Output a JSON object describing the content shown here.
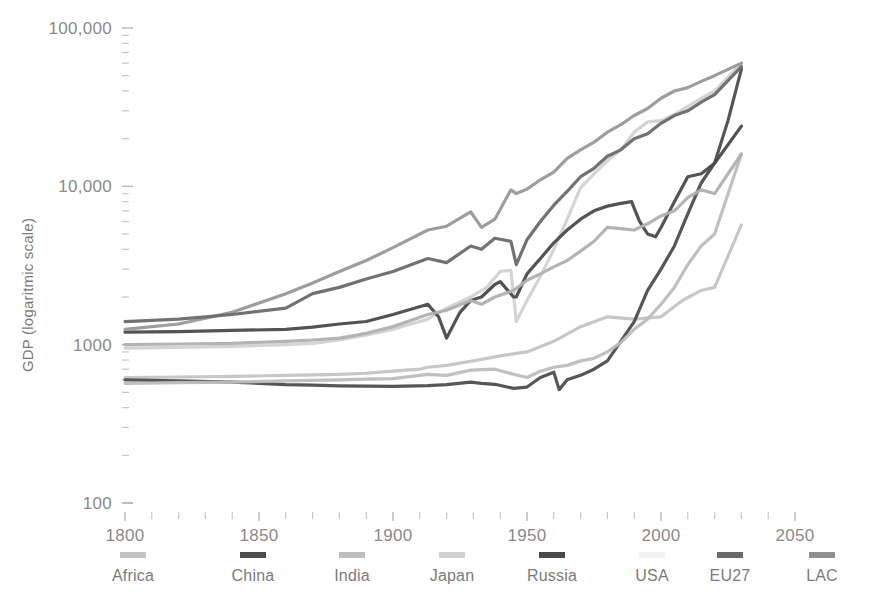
{
  "chart_data": {
    "type": "line",
    "title": "",
    "subtitle": "",
    "xlabel": "",
    "ylabel": "GDP (logaritmic scale)",
    "y_scale": "log",
    "ylim": [
      100,
      100000
    ],
    "xlim": [
      1800,
      2050
    ],
    "y_ticks": [
      "100",
      "1000",
      "10,000",
      "100,000"
    ],
    "y_tick_values": [
      100,
      1000,
      10000,
      100000
    ],
    "x_ticks": [
      "1800",
      "1850",
      "1900",
      "1950",
      "2000",
      "2050"
    ],
    "x_tick_values": [
      1800,
      1850,
      1900,
      1950,
      2000,
      2050
    ],
    "x_minor_step": 10,
    "grid": false,
    "legend_position": "bottom",
    "legend": [
      "Africa",
      "China",
      "India",
      "Japan",
      "Russia",
      "USA",
      "EU27",
      "LAC"
    ],
    "series": [
      {
        "name": "Africa",
        "color": "#c4c4c4",
        "x": [
          1800,
          1820,
          1840,
          1860,
          1870,
          1880,
          1890,
          1900,
          1910,
          1913,
          1920,
          1930,
          1940,
          1950,
          1960,
          1970,
          1980,
          1990,
          2000,
          2008,
          2015,
          2020,
          2030
        ],
        "values": [
          620,
          625,
          630,
          640,
          645,
          650,
          660,
          680,
          700,
          720,
          740,
          790,
          850,
          900,
          1050,
          1300,
          1500,
          1450,
          1500,
          1900,
          2200,
          2300,
          5700
        ]
      },
      {
        "name": "China",
        "color": "#4d4d4d",
        "x": [
          1800,
          1820,
          1840,
          1860,
          1870,
          1880,
          1890,
          1900,
          1913,
          1920,
          1929,
          1933,
          1938,
          1945,
          1950,
          1955,
          1960,
          1962,
          1965,
          1970,
          1975,
          1980,
          1985,
          1990,
          1995,
          2000,
          2005,
          2010,
          2015,
          2020,
          2025,
          2030
        ],
        "values": [
          600,
          590,
          580,
          560,
          555,
          550,
          548,
          545,
          552,
          560,
          580,
          570,
          562,
          530,
          540,
          620,
          670,
          520,
          600,
          640,
          700,
          790,
          1050,
          1400,
          2200,
          3000,
          4200,
          6700,
          10500,
          14000,
          26000,
          55000
        ]
      },
      {
        "name": "India",
        "color": "#bdbdbd",
        "x": [
          1800,
          1820,
          1840,
          1860,
          1870,
          1880,
          1890,
          1900,
          1913,
          1920,
          1929,
          1938,
          1945,
          1950,
          1955,
          1960,
          1965,
          1970,
          1975,
          1980,
          1985,
          1990,
          1995,
          2000,
          2005,
          2010,
          2015,
          2020,
          2030
        ],
        "values": [
          570,
          575,
          580,
          590,
          595,
          600,
          605,
          610,
          650,
          640,
          690,
          700,
          650,
          620,
          680,
          720,
          740,
          790,
          820,
          900,
          1030,
          1250,
          1450,
          1800,
          2300,
          3200,
          4200,
          5000,
          16000
        ]
      },
      {
        "name": "Japan",
        "color": "#d2d2d2",
        "x": [
          1800,
          1820,
          1840,
          1860,
          1870,
          1880,
          1890,
          1900,
          1913,
          1920,
          1929,
          1935,
          1940,
          1944,
          1946,
          1950,
          1955,
          1960,
          1965,
          1970,
          1975,
          1980,
          1985,
          1990,
          1995,
          2000,
          2005,
          2010,
          2015,
          2020,
          2030
        ],
        "values": [
          950,
          960,
          975,
          1000,
          1020,
          1070,
          1150,
          1250,
          1450,
          1700,
          2000,
          2300,
          2900,
          2950,
          1400,
          1900,
          2700,
          4000,
          6200,
          9800,
          12000,
          14500,
          17000,
          22000,
          25500,
          26000,
          28500,
          32000,
          36000,
          40000,
          60000
        ]
      },
      {
        "name": "Russia",
        "color": "#4a4a4a",
        "x": [
          1800,
          1820,
          1840,
          1860,
          1870,
          1880,
          1890,
          1900,
          1913,
          1917,
          1920,
          1925,
          1929,
          1933,
          1938,
          1940,
          1945,
          1946,
          1950,
          1955,
          1960,
          1965,
          1970,
          1975,
          1980,
          1985,
          1989,
          1992,
          1995,
          1998,
          2000,
          2005,
          2010,
          2015,
          2020,
          2030
        ],
        "values": [
          1200,
          1210,
          1230,
          1250,
          1290,
          1350,
          1400,
          1550,
          1800,
          1500,
          1100,
          1600,
          1900,
          2000,
          2400,
          2500,
          2000,
          2000,
          2800,
          3500,
          4400,
          5300,
          6200,
          7000,
          7500,
          7800,
          8000,
          6000,
          5000,
          4800,
          5500,
          8000,
          11500,
          12000,
          14000,
          24000
        ]
      },
      {
        "name": "USA",
        "color": "#989898",
        "x": [
          1800,
          1820,
          1840,
          1860,
          1870,
          1880,
          1890,
          1900,
          1913,
          1920,
          1929,
          1933,
          1938,
          1944,
          1946,
          1950,
          1955,
          1960,
          1965,
          1970,
          1975,
          1980,
          1985,
          1990,
          1995,
          2000,
          2005,
          2010,
          2015,
          2020,
          2030
        ],
        "values": [
          1250,
          1350,
          1600,
          2100,
          2450,
          2900,
          3400,
          4100,
          5300,
          5600,
          6900,
          5500,
          6200,
          9500,
          9000,
          9600,
          11000,
          12300,
          15000,
          17000,
          19000,
          22000,
          24500,
          28000,
          31000,
          36000,
          40000,
          42000,
          46000,
          50000,
          60000
        ]
      },
      {
        "name": "EU27",
        "color": "#6a6a6a",
        "x": [
          1800,
          1820,
          1840,
          1860,
          1870,
          1880,
          1890,
          1900,
          1913,
          1920,
          1929,
          1933,
          1938,
          1944,
          1946,
          1950,
          1955,
          1960,
          1965,
          1970,
          1975,
          1980,
          1985,
          1990,
          1995,
          2000,
          2005,
          2010,
          2015,
          2020,
          2030
        ],
        "values": [
          1400,
          1450,
          1550,
          1700,
          2100,
          2300,
          2600,
          2900,
          3500,
          3300,
          4200,
          4000,
          4700,
          4500,
          3200,
          4600,
          6000,
          7600,
          9300,
          11500,
          13000,
          15500,
          17000,
          20000,
          21500,
          25000,
          28000,
          30000,
          34000,
          38000,
          57000
        ]
      },
      {
        "name": "LAC",
        "color": "#b0b0b0",
        "x": [
          1800,
          1820,
          1840,
          1860,
          1870,
          1880,
          1890,
          1900,
          1913,
          1920,
          1929,
          1933,
          1938,
          1945,
          1950,
          1955,
          1960,
          1965,
          1970,
          1975,
          1980,
          1985,
          1990,
          1995,
          2000,
          2005,
          2010,
          2015,
          2020,
          2030
        ],
        "values": [
          1000,
          1010,
          1020,
          1050,
          1070,
          1100,
          1180,
          1300,
          1550,
          1650,
          1900,
          1800,
          2000,
          2200,
          2550,
          2800,
          3100,
          3400,
          3900,
          4500,
          5500,
          5400,
          5300,
          5800,
          6500,
          7000,
          8500,
          9500,
          9000,
          16000
        ]
      }
    ]
  },
  "legend_items": [
    {
      "label": "Africa",
      "color": "#c4c4c4"
    },
    {
      "label": "China",
      "color": "#4d4d4d"
    },
    {
      "label": "India",
      "color": "#bdbdbd"
    },
    {
      "label": "Japan",
      "color": "#d2d2d2"
    },
    {
      "label": "Russia",
      "color": "#4a4a4a"
    },
    {
      "label": "USA",
      "color": "#f2f2f2"
    },
    {
      "label": "EU27",
      "color": "#6a6a6a"
    },
    {
      "label": "LAC",
      "color": "#8f8f8f"
    }
  ],
  "colors": {
    "background": "#ffffff",
    "text": "#7f7f7f",
    "tick": "#bdbdbd"
  }
}
